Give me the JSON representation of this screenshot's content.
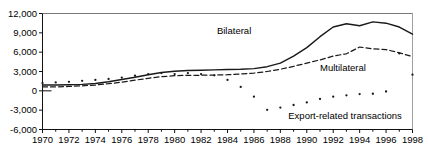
{
  "top_note": "",
  "chart_data": {
    "type": "line",
    "title": "",
    "subtitle": "",
    "xlabel": "",
    "ylabel": "",
    "grid": false,
    "legend_position": "inline-annotations",
    "xlim": [
      1970,
      1998
    ],
    "ylim": [
      -6000,
      12000
    ],
    "ytick_labels": [
      "12,000",
      "9,000",
      "6,000",
      "3,000",
      "0",
      "-3,000",
      "-6,000"
    ],
    "ytick_values": [
      12000,
      9000,
      6000,
      3000,
      0,
      -3000,
      -6000
    ],
    "xtick_labels": [
      "1970",
      "1972",
      "1974",
      "1976",
      "1978",
      "1980",
      "1982",
      "1984",
      "1986",
      "1988",
      "1990",
      "1992",
      "1994",
      "1996",
      "1998"
    ],
    "xtick_values": [
      1970,
      1972,
      1974,
      1976,
      1978,
      1980,
      1982,
      1984,
      1986,
      1988,
      1990,
      1992,
      1994,
      1996,
      1998
    ],
    "minor_xticks": [
      1971,
      1973,
      1975,
      1977,
      1979,
      1981,
      1983,
      1985,
      1987,
      1989,
      1991,
      1993,
      1995,
      1997
    ],
    "x": [
      1970,
      1971,
      1972,
      1973,
      1974,
      1975,
      1976,
      1977,
      1978,
      1979,
      1980,
      1981,
      1982,
      1983,
      1984,
      1985,
      1986,
      1987,
      1988,
      1989,
      1990,
      1991,
      1992,
      1993,
      1994,
      1995,
      1996,
      1997,
      1998
    ],
    "series": [
      {
        "name": "Bilateral",
        "style": "solid",
        "color": "#1a1a1a",
        "label_x": 1983.2,
        "label_y": 9300,
        "values": [
          900,
          900,
          950,
          1000,
          1150,
          1400,
          1750,
          2100,
          2500,
          2850,
          3050,
          3150,
          3200,
          3250,
          3300,
          3350,
          3450,
          3750,
          4300,
          5400,
          6700,
          8400,
          9900,
          10400,
          10100,
          10700,
          10500,
          9900,
          8800
        ]
      },
      {
        "name": "Multilateral",
        "style": "dashed",
        "color": "#1a1a1a",
        "label_x": 1991.0,
        "label_y": 3600,
        "values": [
          600,
          620,
          680,
          780,
          900,
          1100,
          1350,
          1650,
          1950,
          2200,
          2350,
          2400,
          2420,
          2450,
          2500,
          2600,
          2750,
          3000,
          3350,
          3800,
          4300,
          4800,
          5400,
          5750,
          6800,
          6500,
          6400,
          5900,
          5300
        ]
      },
      {
        "name": "Export-related transactions",
        "style": "dotted",
        "color": "#1a1a1a",
        "label_x": 1988.6,
        "label_y": -3850,
        "values": [
          1200,
          1300,
          1400,
          1550,
          1700,
          1850,
          2050,
          2350,
          2600,
          2750,
          2600,
          2750,
          2600,
          2400,
          1700,
          600,
          -900,
          -2950,
          -2600,
          -2200,
          -1800,
          -1250,
          -900,
          -700,
          -500,
          -450,
          -100,
          5800,
          2500
        ]
      }
    ]
  }
}
